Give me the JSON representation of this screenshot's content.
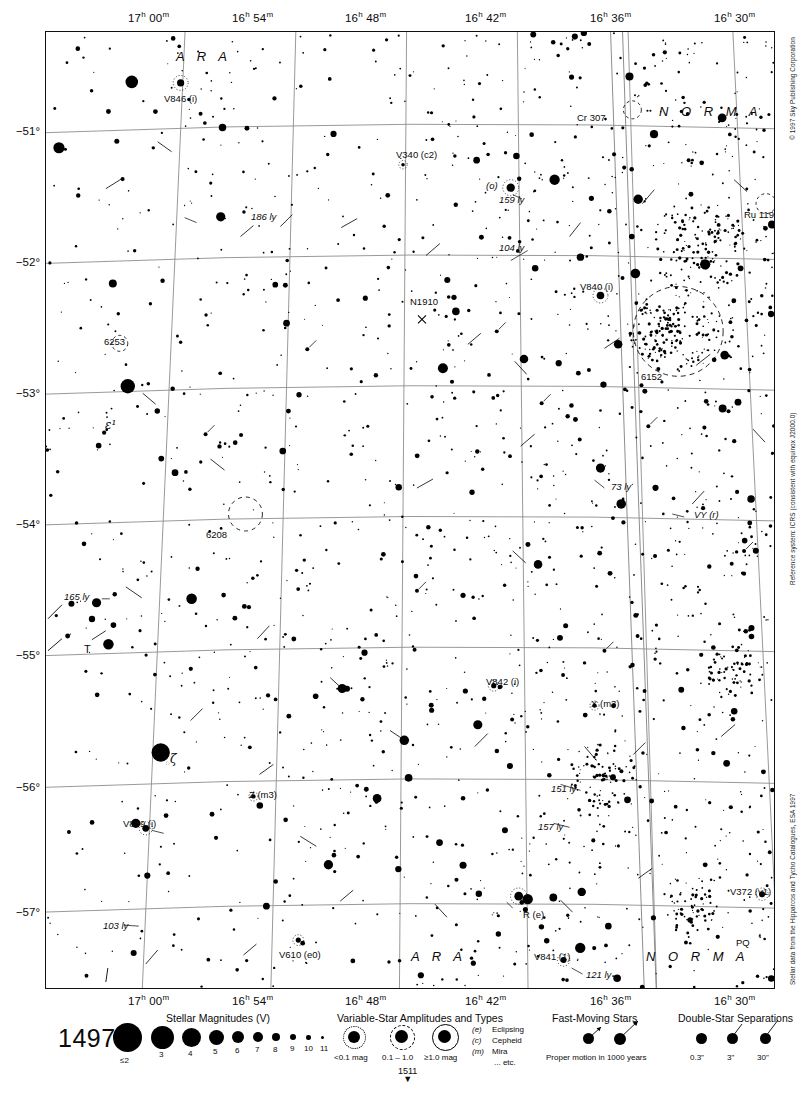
{
  "chart_data": {
    "type": "scatter",
    "xlabel": "Right Ascension",
    "ylabel": "Declination",
    "xlim": [
      "17h 02m",
      "16h 27m"
    ],
    "ylim": [
      -57.6,
      -50.4
    ],
    "grid": true,
    "ra_ticks": [
      "17h 00m",
      "16h 54m",
      "16h 48m",
      "16h 42m",
      "16h 36m",
      "16h 30m"
    ],
    "dec_ticks": [
      "-51°",
      "-52°",
      "-53°",
      "-54°",
      "-55°",
      "-56°",
      "-57°"
    ],
    "constellations": [
      "A R A",
      "N O R M A"
    ],
    "annotations": [
      {
        "label": "V846 (i)",
        "kind": "variable-star"
      },
      {
        "label": "V340 (c2)",
        "kind": "variable-star"
      },
      {
        "label": "V840 (i)",
        "kind": "variable-star"
      },
      {
        "label": "V842 (i)",
        "kind": "variable-star"
      },
      {
        "label": "V841 (1)",
        "kind": "variable-star"
      },
      {
        "label": "V849 (i)",
        "kind": "variable-star"
      },
      {
        "label": "V610 (e0)",
        "kind": "variable-star"
      },
      {
        "label": "V372 (v1)",
        "kind": "variable-star"
      },
      {
        "label": "R (e)",
        "kind": "variable-star"
      },
      {
        "label": "X (m3)",
        "kind": "variable-star"
      },
      {
        "label": "Z (m3)",
        "kind": "variable-star"
      },
      {
        "label": "T",
        "kind": "variable-star"
      },
      {
        "label": "PQ",
        "kind": "variable-star"
      },
      {
        "label": "VY (r)",
        "kind": "variable-star"
      },
      {
        "label": "(o)",
        "kind": "star-designation"
      },
      {
        "label": "ε¹",
        "kind": "star-designation"
      },
      {
        "label": "ζ",
        "kind": "star-designation"
      },
      {
        "label": "Cr 307",
        "kind": "open-cluster"
      },
      {
        "label": "Ru 119",
        "kind": "open-cluster"
      },
      {
        "label": "6253",
        "kind": "open-cluster"
      },
      {
        "label": "6208",
        "kind": "open-cluster"
      },
      {
        "label": "6152",
        "kind": "open-cluster"
      },
      {
        "label": "N1910",
        "kind": "galaxy"
      },
      {
        "label": "186 ly",
        "kind": "distance"
      },
      {
        "label": "159 ly",
        "kind": "distance"
      },
      {
        "label": "104 ly",
        "kind": "distance"
      },
      {
        "label": "73 ly",
        "kind": "distance"
      },
      {
        "label": "165 ly",
        "kind": "distance"
      },
      {
        "label": "151 ly",
        "kind": "distance"
      },
      {
        "label": "157 ly",
        "kind": "distance"
      },
      {
        "label": "121 ly",
        "kind": "distance"
      },
      {
        "label": "103 ly",
        "kind": "distance"
      }
    ]
  },
  "axes": {
    "ra_top": [
      {
        "h": "17",
        "m": "00"
      },
      {
        "h": "16",
        "m": "54"
      },
      {
        "h": "16",
        "m": "48"
      },
      {
        "h": "16",
        "m": "42"
      },
      {
        "h": "16",
        "m": "36"
      },
      {
        "h": "16",
        "m": "30"
      }
    ],
    "ra_bottom": [
      {
        "h": "17",
        "m": "00"
      },
      {
        "h": "16",
        "m": "54"
      },
      {
        "h": "16",
        "m": "48"
      },
      {
        "h": "16",
        "m": "42"
      },
      {
        "h": "16",
        "m": "36"
      },
      {
        "h": "16",
        "m": "30"
      }
    ],
    "dec": [
      "−51°",
      "−52°",
      "−53°",
      "−54°",
      "−55°",
      "−56°",
      "−57°"
    ]
  },
  "chart_labels": {
    "ara_top": "A R A",
    "ara_bottom": "A R A",
    "norma_top": "N O R M A",
    "norma_bottom": "N O R M A",
    "v846": "V846 (i)",
    "v340": "V340 (c2)",
    "v840": "V840 (i)",
    "v842": "V842 (i)",
    "v841": "V841 (1)",
    "v849": "V849 (i)",
    "v610": "V610 (e0)",
    "v372": "V372 (v1)",
    "r_e": "R (e)",
    "x_m3": "X (m3)",
    "z_m3": "Z (m3)",
    "t_star": "T",
    "pq": "PQ",
    "vy_r": "VY (r)",
    "omicron": "(o)",
    "epsilon1": "ε¹",
    "zeta": "ζ",
    "cr307": "Cr 307",
    "ru119": "Ru 119",
    "ngc6253": "6253",
    "ngc6208": "6208",
    "ngc6152": "6152",
    "n1910": "N1910",
    "ly186": "186 ly",
    "ly159": "159 ly",
    "ly104": "104 ly",
    "ly73": "73 ly",
    "ly165": "165 ly",
    "ly151": "151 ly",
    "ly157": "157 ly",
    "ly121": "121 ly",
    "ly103": "103 ly"
  },
  "credits": {
    "copyright": "© 1997 Sky Publishing Corporation",
    "reference": "Reference system: ICRS (consistent with equinox J2000.0)",
    "source": "Stellar data from the Hipparcos and Tycho Catalogues, ESA 1997"
  },
  "legend": {
    "chart_number": "1497",
    "adjacent_chart": "1511",
    "adjacent_arrow": "▼",
    "magnitudes": {
      "title": "Stellar Magnitudes (V)",
      "labels": [
        "≤2",
        "3",
        "4",
        "5",
        "6",
        "7",
        "8",
        "9",
        "10",
        "11"
      ]
    },
    "variables": {
      "title": "Variable-Star Amplitudes and Types",
      "amplitudes": [
        "<0.1 mag",
        "0.1 – 1.0",
        "≥1.0 mag"
      ],
      "types": [
        {
          "code": "(e)",
          "name": "Eclipsing"
        },
        {
          "code": "(c)",
          "name": "Cepheid"
        },
        {
          "code": "(m)",
          "name": "Mira"
        },
        {
          "code": "",
          "name": "... etc."
        }
      ]
    },
    "fast_moving": {
      "title": "Fast-Moving Stars",
      "caption": "Proper motion in 1000 years"
    },
    "doubles": {
      "title": "Double-Star Separations",
      "labels": [
        "0.3\"",
        "3\"",
        "30\""
      ]
    }
  }
}
